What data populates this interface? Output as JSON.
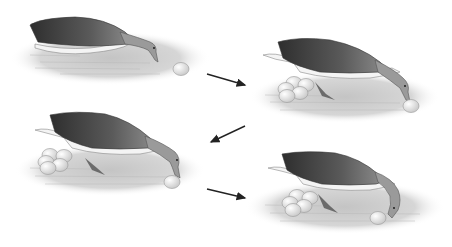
{
  "figure": {
    "panels": [
      {
        "id": 1,
        "label": "goose-sees-egg",
        "eggs_in_nest": 0
      },
      {
        "id": 2,
        "label": "goose-reaches-egg",
        "eggs_in_nest": 5
      },
      {
        "id": 3,
        "label": "goose-rolls-egg",
        "eggs_in_nest": 5
      },
      {
        "id": 4,
        "label": "goose-retrieves-egg",
        "eggs_in_nest": 5
      }
    ],
    "arrows": [
      {
        "from": 1,
        "to": 2,
        "direction": "down-right"
      },
      {
        "from": 2,
        "to": 3,
        "direction": "down-left"
      },
      {
        "from": 3,
        "to": 4,
        "direction": "down-right"
      }
    ],
    "colors": {
      "background": "#ffffff",
      "nest": "#cfcfcf",
      "wing_dark": "#3a3a3a",
      "wing_mid": "#6b6b6b",
      "neck": "#9a9a9a",
      "belly": "#f4f4f4",
      "egg": "#f2f2f2",
      "arrow": "#222222"
    }
  }
}
